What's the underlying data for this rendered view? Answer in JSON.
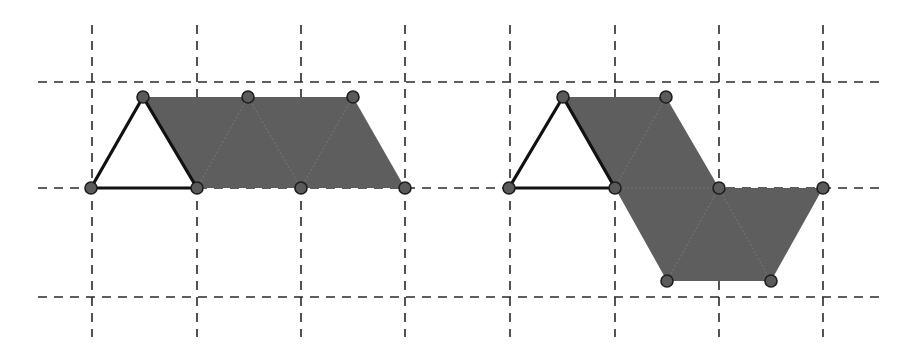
{
  "diagram": {
    "colors": {
      "background": "#ffffff",
      "grid": "#2a2a2a",
      "fill": "#5e5e5e",
      "triangle_stroke": "#111111",
      "vertex_fill": "#5a5a5a",
      "vertex_stroke": "#1e1e1e"
    },
    "grid": {
      "horizontal_y": [
        82,
        188,
        297
      ],
      "horizontal_x_range": [
        38,
        880
      ],
      "vertical_x": [
        92,
        197,
        301,
        405,
        510,
        615,
        719,
        823
      ],
      "vertical_y_range": [
        25,
        337
      ]
    },
    "figures": [
      {
        "name": "left-figure",
        "triangle": [
          [
            91,
            188
          ],
          [
            143,
            97
          ],
          [
            197,
            188
          ]
        ],
        "shaded_polygon": [
          [
            143,
            97
          ],
          [
            353,
            97
          ],
          [
            405,
            188
          ],
          [
            197,
            188
          ]
        ],
        "inner_lines": [
          [
            [
              197,
              188
            ],
            [
              248,
              97
            ]
          ],
          [
            [
              248,
              97
            ],
            [
              301,
              188
            ]
          ],
          [
            [
              301,
              188
            ],
            [
              353,
              97
            ]
          ]
        ],
        "vertices": [
          [
            91,
            188
          ],
          [
            143,
            97
          ],
          [
            197,
            188
          ],
          [
            248,
            97
          ],
          [
            353,
            97
          ],
          [
            301,
            188
          ],
          [
            405,
            188
          ]
        ]
      },
      {
        "name": "right-figure",
        "triangle": [
          [
            509,
            188
          ],
          [
            563,
            97
          ],
          [
            615,
            188
          ]
        ],
        "shaded_polygon": [
          [
            563,
            97
          ],
          [
            666,
            97
          ],
          [
            719,
            188
          ],
          [
            823,
            188
          ],
          [
            771,
            281
          ],
          [
            667,
            281
          ],
          [
            615,
            188
          ]
        ],
        "inner_lines": [
          [
            [
              615,
              188
            ],
            [
              666,
              97
            ]
          ],
          [
            [
              615,
              188
            ],
            [
              719,
              188
            ]
          ],
          [
            [
              667,
              281
            ],
            [
              719,
              188
            ]
          ],
          [
            [
              719,
              188
            ],
            [
              771,
              281
            ]
          ]
        ],
        "vertices": [
          [
            509,
            188
          ],
          [
            563,
            97
          ],
          [
            615,
            188
          ],
          [
            666,
            97
          ],
          [
            719,
            188
          ],
          [
            823,
            188
          ],
          [
            667,
            281
          ],
          [
            771,
            281
          ]
        ]
      }
    ]
  }
}
